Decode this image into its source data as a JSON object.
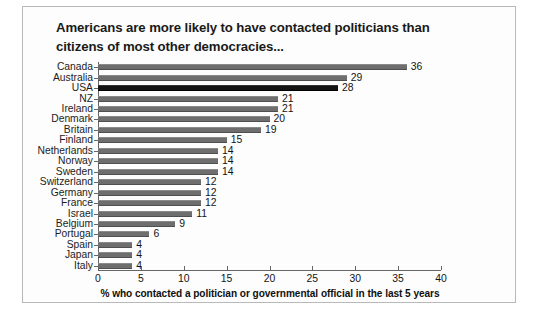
{
  "title": "Americans are more likely to have contacted politicians than citizens of most other democracies...",
  "xlabel": "% who contacted a politician or governmental official in the last 5 years",
  "colors": {
    "bar": "#6e6e6e",
    "bar_highlight": "#141414",
    "axis": "#666666",
    "frame": "#b9b9b9",
    "background": "#fdfdfd",
    "text": "#141414"
  },
  "highlight_category": "USA",
  "chart_data": {
    "type": "bar",
    "orientation": "horizontal",
    "title": "Americans are more likely to have contacted politicians than citizens of most other democracies...",
    "xlabel": "% who contacted a politician or governmental official in the last 5 years",
    "ylabel": "",
    "xlim": [
      0,
      40
    ],
    "xticks": [
      0,
      5,
      10,
      15,
      20,
      25,
      30,
      35,
      40
    ],
    "grid": false,
    "legend": false,
    "categories": [
      "Canada",
      "Australia",
      "USA",
      "NZ",
      "Ireland",
      "Denmark",
      "Britain",
      "Finland",
      "Netherlands",
      "Norway",
      "Sweden",
      "Switzerland",
      "Germany",
      "France",
      "Israel",
      "Belgium",
      "Portugal",
      "Spain",
      "Japan",
      "Italy"
    ],
    "values": [
      36,
      29,
      28,
      21,
      21,
      20,
      19,
      15,
      14,
      14,
      14,
      12,
      12,
      12,
      11,
      9,
      6,
      4,
      4,
      4
    ],
    "data_labels": [
      "36",
      "29",
      "28",
      "21",
      "21",
      "20",
      "19",
      "15",
      "14",
      "14",
      "14",
      "12",
      "12",
      "12",
      "11",
      "9",
      "6",
      "4",
      "4",
      "4"
    ]
  }
}
